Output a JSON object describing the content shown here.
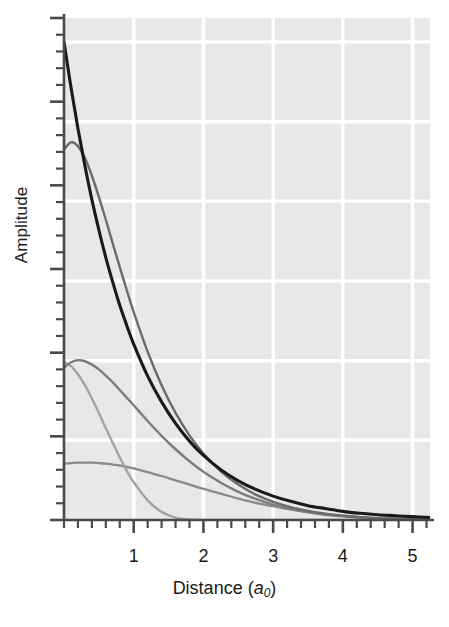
{
  "figure": {
    "name": "radial-wavefunction-amplitude-plot",
    "background_color": "#ffffff",
    "plot_background_color": "#e8e8e8",
    "gridline_color": "#ffffff",
    "axis_color": "#4a4a4a"
  },
  "chart_data": {
    "type": "line",
    "title": "",
    "xlabel": "Distance (a₀)",
    "xlabel_parts": {
      "text": "Distance (",
      "italic": "a",
      "sub": "0",
      "close": ")"
    },
    "ylabel": "Amplitude",
    "xlim": [
      0,
      5.25
    ],
    "ylim": [
      0,
      1.05
    ],
    "grid": true,
    "grid_x_values": [
      1,
      2,
      3,
      4,
      5
    ],
    "grid_y_values": [
      0.167,
      0.333,
      0.5,
      0.667,
      0.833,
      1.0
    ],
    "legend_position": "none",
    "x_tick_labels": [
      "1",
      "2",
      "3",
      "4",
      "5"
    ],
    "x_major_ticks": [
      1,
      2,
      3,
      4,
      5
    ],
    "x_minor_tick_step": 0.2,
    "y_tick_labels": [],
    "y_major_tick_count": 7,
    "y_minor_per_major": 4,
    "x": [
      0,
      0.1,
      0.2,
      0.3,
      0.4,
      0.5,
      0.6,
      0.7,
      0.8,
      0.9,
      1,
      1.2,
      1.4,
      1.6,
      1.8,
      2,
      2.25,
      2.5,
      2.75,
      3,
      3.25,
      3.5,
      3.75,
      4,
      4.25,
      4.5,
      4.75,
      5,
      5.25
    ],
    "series": [
      {
        "name": "curve-1",
        "color": "#1a1a1a",
        "width": 3.1,
        "description": "steepest exponential decay starting at top of axis",
        "values": [
          1.0,
          0.905,
          0.819,
          0.741,
          0.67,
          0.607,
          0.549,
          0.497,
          0.449,
          0.407,
          0.368,
          0.301,
          0.247,
          0.202,
          0.165,
          0.135,
          0.105,
          0.082,
          0.064,
          0.05,
          0.039,
          0.03,
          0.024,
          0.018,
          0.014,
          0.011,
          0.009,
          0.007,
          0.005
        ]
      },
      {
        "name": "curve-2",
        "color": "#6b6b6b",
        "width": 2.4,
        "description": "second curve, rounded maximum near origin at ~0.78 amplitude",
        "values": [
          0.775,
          0.79,
          0.782,
          0.757,
          0.72,
          0.676,
          0.628,
          0.578,
          0.529,
          0.481,
          0.435,
          0.352,
          0.282,
          0.224,
          0.177,
          0.139,
          0.102,
          0.074,
          0.053,
          0.038,
          0.027,
          0.019,
          0.013,
          0.009,
          0.006,
          0.004,
          0.003,
          0.002,
          0.001
        ]
      },
      {
        "name": "curve-3",
        "color": "#7d7d7d",
        "width": 2.4,
        "description": "broad intermediate curve peaking just right of origin at ~0.33",
        "values": [
          0.318,
          0.33,
          0.334,
          0.332,
          0.325,
          0.315,
          0.302,
          0.288,
          0.272,
          0.256,
          0.24,
          0.207,
          0.176,
          0.148,
          0.123,
          0.101,
          0.078,
          0.059,
          0.044,
          0.032,
          0.023,
          0.016,
          0.011,
          0.008,
          0.005,
          0.003,
          0.002,
          0.001,
          0.001
        ]
      },
      {
        "name": "curve-4",
        "color": "#a3a3a3",
        "width": 2.4,
        "description": "sharply falling curve reaching baseline near 1.5",
        "values": [
          0.33,
          0.322,
          0.305,
          0.282,
          0.254,
          0.224,
          0.192,
          0.161,
          0.131,
          0.103,
          0.079,
          0.041,
          0.017,
          0.005,
          0.001,
          0.0,
          0.0,
          0.0,
          0.0,
          0.0,
          0.0,
          0.0,
          0.0,
          0.0,
          0.0,
          0.0,
          0.0,
          0.0,
          0.0
        ]
      },
      {
        "name": "curve-5",
        "color": "#8a8a8a",
        "width": 2.3,
        "description": "lowest, nearly flat curve from ~0.12 slowly decaying to zero by 4.5",
        "values": [
          0.118,
          0.119,
          0.12,
          0.12,
          0.12,
          0.119,
          0.118,
          0.116,
          0.114,
          0.111,
          0.108,
          0.1,
          0.092,
          0.083,
          0.074,
          0.065,
          0.055,
          0.045,
          0.036,
          0.029,
          0.022,
          0.017,
          0.012,
          0.009,
          0.006,
          0.004,
          0.002,
          0.001,
          0.0
        ]
      }
    ]
  }
}
